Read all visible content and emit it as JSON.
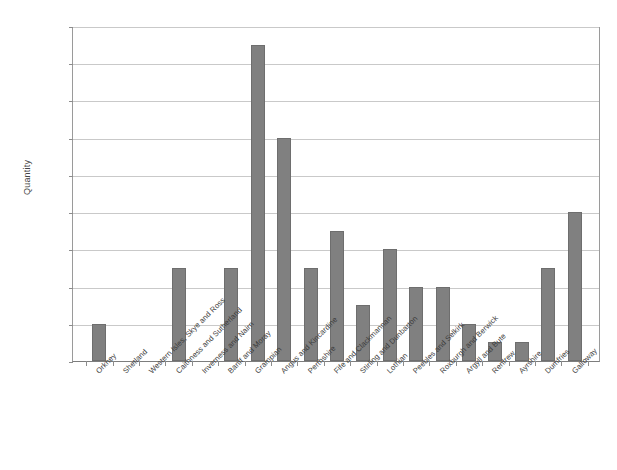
{
  "chart_data": {
    "type": "bar",
    "title": "",
    "xlabel": "",
    "ylabel": "Quantity",
    "ylim": [
      0,
      18
    ],
    "ytick_step": 2,
    "yticks": [
      0,
      2,
      4,
      6,
      8,
      10,
      12,
      14,
      16,
      18
    ],
    "grid": true,
    "legend": "none",
    "bar_color": "#808080",
    "categories": [
      "Orkney",
      "Shetland",
      "Western Isles, Skye and Ross",
      "Caithness and Sutherland",
      "Inverness and Nairn",
      "Banff and Moray",
      "Grampian",
      "Angus and Kincardine",
      "Perthshire",
      "Fife and Clackmannan",
      "Stirling and Dunbarton",
      "Lothian",
      "Peebles and Selkirk",
      "Roxburgh and Berwick",
      "Argyll and Bute",
      "Renfrew",
      "Ayrshire",
      "Dumfries",
      "Galloway"
    ],
    "values": [
      2,
      0,
      0,
      5,
      0,
      5,
      17,
      12,
      5,
      7,
      3,
      6,
      4,
      4,
      2,
      1,
      1,
      5,
      8
    ]
  }
}
